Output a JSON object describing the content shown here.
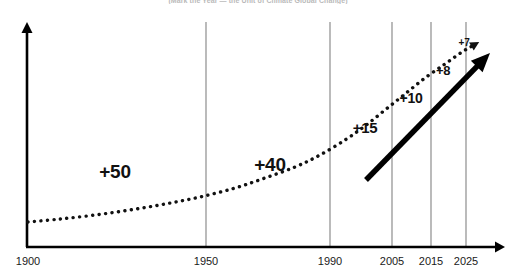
{
  "chart_data": {
    "type": "line",
    "title": "(Mark the Year — the Unit of Climate Global Change)",
    "xlabel": "",
    "ylabel": "",
    "grid": true,
    "legend_position": "none",
    "xlim": [
      1900,
      2030
    ],
    "tick_labels": [
      "1900",
      "1950",
      "1990",
      "2005",
      "2015",
      "2025"
    ],
    "ticks": [
      {
        "label": "1900",
        "year": 1900,
        "px": 28,
        "gridline": false
      },
      {
        "label": "1950",
        "year": 1950,
        "px": 206,
        "gridline": true
      },
      {
        "label": "1990",
        "year": 1990,
        "px": 330,
        "gridline": true
      },
      {
        "label": "2005",
        "year": 2005,
        "px": 392,
        "gridline": true
      },
      {
        "label": "2015",
        "year": 2015,
        "px": 431,
        "gridline": true
      },
      {
        "label": "2025",
        "year": 2025,
        "px": 466,
        "gridline": true
      }
    ],
    "annotations": [
      {
        "label": "+50",
        "value": 50,
        "span": "1900-1950",
        "x": 115,
        "y": 172,
        "size": 19
      },
      {
        "label": "+40",
        "value": 40,
        "span": "1950-1990",
        "x": 270,
        "y": 165,
        "size": 19
      },
      {
        "label": "+15",
        "value": 15,
        "span": "1990-2005",
        "x": 365,
        "y": 127,
        "size": 15
      },
      {
        "label": "+10",
        "value": 10,
        "span": "2005-2015",
        "x": 411,
        "y": 98,
        "size": 14
      },
      {
        "label": "+8",
        "value": 8,
        "span": "2015-2025",
        "x": 443,
        "y": 70,
        "size": 13
      },
      {
        "label": "+7",
        "value": 7,
        "span": "2025+",
        "x": 464,
        "y": 42,
        "size": 10
      }
    ],
    "series": [
      {
        "name": "dotted-trend-curve",
        "style": "dotted",
        "color": "#111111",
        "points": [
          [
            28,
            222
          ],
          [
            60,
            219
          ],
          [
            95,
            215
          ],
          [
            130,
            210
          ],
          [
            165,
            204
          ],
          [
            200,
            197
          ],
          [
            235,
            188
          ],
          [
            265,
            178
          ],
          [
            295,
            167
          ],
          [
            320,
            155
          ],
          [
            345,
            140
          ],
          [
            365,
            126
          ],
          [
            385,
            110
          ],
          [
            405,
            94
          ],
          [
            425,
            78
          ],
          [
            445,
            64
          ],
          [
            462,
            52
          ],
          [
            474,
            45
          ]
        ]
      },
      {
        "name": "bold-projection-arrow",
        "style": "solid-arrow",
        "color": "#000000",
        "start": [
          366,
          180
        ],
        "end": [
          490,
          53
        ]
      }
    ],
    "axes": {
      "y_axis": {
        "x": 27,
        "top": 22,
        "bottom": 248,
        "arrow": "up"
      },
      "x_axis": {
        "y": 247,
        "left": 27,
        "right": 505,
        "arrow": "right"
      }
    },
    "colors": {
      "background": "#ffffff",
      "axis": "#000000",
      "gridline": "#8d8d8d",
      "curve": "#111111",
      "arrow": "#000000",
      "title": "#b9b9b9",
      "tick_text": "#1a1a1a"
    }
  }
}
